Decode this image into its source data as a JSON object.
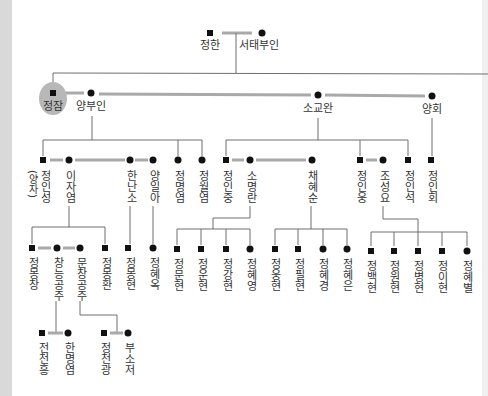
{
  "figure": {
    "type": "family-tree"
  },
  "colors": {
    "highlight": "#b8b8b8",
    "tree_line": "#6e6e6e",
    "marriage_line": "#a9a9a9",
    "marker": "#111111",
    "side_strip": "#d9d9d9"
  },
  "people": {
    "g0": [
      {
        "name": "정한",
        "marker": "square"
      },
      {
        "name": "서태부인",
        "marker": "circle"
      }
    ],
    "g1": [
      {
        "name": "정잠",
        "marker": "square",
        "highlighted": true
      },
      {
        "name": "양부인",
        "marker": "circle"
      },
      {
        "name": "소교완",
        "marker": "circle"
      },
      {
        "name": "양회",
        "marker": "circle"
      }
    ],
    "g2": [
      {
        "name": "정인성",
        "marker": "square"
      },
      {
        "name": "이자염",
        "marker": "circle"
      },
      {
        "name": "한난소",
        "marker": "circle"
      },
      {
        "name": "양일아",
        "marker": "circle"
      },
      {
        "name": "정명염",
        "marker": "circle"
      },
      {
        "name": "정월염",
        "marker": "circle"
      },
      {
        "name": "정인중",
        "marker": "square"
      },
      {
        "name": "소명란",
        "marker": "circle"
      },
      {
        "name": "채혜순",
        "marker": "circle"
      },
      {
        "name": "정인웅",
        "marker": "square"
      },
      {
        "name": "조성요",
        "marker": "circle"
      },
      {
        "name": "정인석",
        "marker": "square"
      },
      {
        "name": "정인회",
        "marker": "square"
      }
    ],
    "g3": [
      {
        "name": "정몽창",
        "marker": "square"
      },
      {
        "name": "창능공주",
        "marker": "circle"
      },
      {
        "name": "문창공주",
        "marker": "circle"
      },
      {
        "name": "정몽환",
        "marker": "square"
      },
      {
        "name": "정몽현",
        "marker": "square"
      },
      {
        "name": "정혜옥",
        "marker": "circle"
      },
      {
        "name": "정문현",
        "marker": "square"
      },
      {
        "name": "정운현",
        "marker": "square"
      },
      {
        "name": "정강현",
        "marker": "square"
      },
      {
        "name": "정혜영",
        "marker": "circle"
      },
      {
        "name": "정웅현",
        "marker": "square"
      },
      {
        "name": "정필현",
        "marker": "square"
      },
      {
        "name": "정혜경",
        "marker": "circle"
      },
      {
        "name": "정혜은",
        "marker": "circle"
      },
      {
        "name": "정백현",
        "marker": "square"
      },
      {
        "name": "정원현",
        "marker": "square"
      },
      {
        "name": "정병현",
        "marker": "square"
      },
      {
        "name": "정이현",
        "marker": "square"
      },
      {
        "name": "정혜별",
        "marker": "circle"
      }
    ],
    "g4": [
      {
        "name": "전천흥",
        "marker": "square"
      },
      {
        "name": "한명염",
        "marker": "circle"
      },
      {
        "name": "정천광",
        "marker": "square"
      },
      {
        "name": "부소저",
        "marker": "circle"
      }
    ]
  },
  "annotations": {
    "adopted": "(양자)"
  }
}
